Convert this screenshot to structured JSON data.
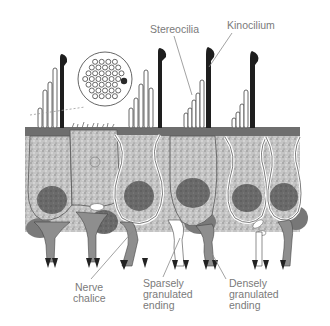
{
  "figure": {
    "labels": {
      "stereocilia": "Stereocilia",
      "kinocilium": "Kinocilium",
      "nerve_chalice": [
        "Nerve",
        "chalice"
      ],
      "sparsely_granulated": [
        "Sparsely",
        "granulated",
        "ending"
      ],
      "densely_granulated": [
        "Densely",
        "granulated",
        "ending"
      ]
    },
    "inset": {
      "description": "Cross-section of hair bundle: stereocilia rings with one filled kinocilium"
    },
    "colors": {
      "label_text": "#7a7a7a",
      "kinocilium": "#1e1e1e",
      "cytoplasm": "#b9b9b9",
      "nucleus": "#6a6a6a",
      "cuticular_plate": "#6e6e6e",
      "nerve_ending": "#8e8e8e",
      "leader_line": "#8a8a8a"
    }
  }
}
